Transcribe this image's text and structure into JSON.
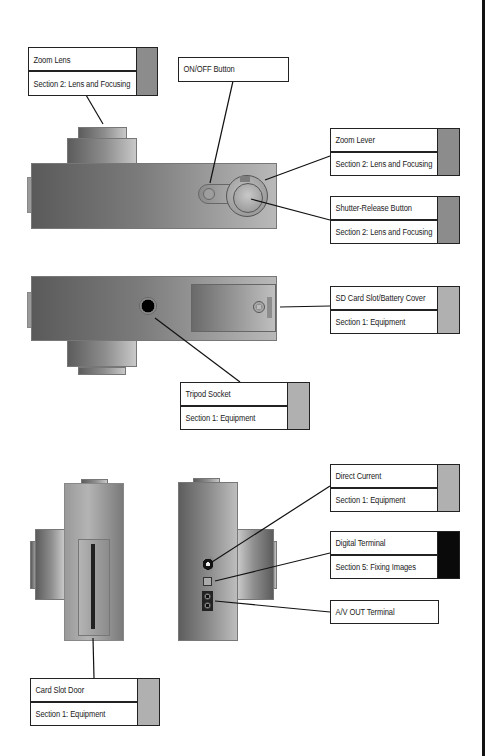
{
  "diagram": {
    "type": "camera-parts-callout",
    "views": [
      "top",
      "bottom",
      "front-side",
      "back-side"
    ]
  },
  "callouts": {
    "zoom_lens": {
      "title": "Zoom Lens",
      "section": "Section 2: Lens and Focusing",
      "swatch_color": "#8c8c8c"
    },
    "on_off": {
      "title": "ON/OFF Button"
    },
    "zoom_lever": {
      "title": "Zoom Lever",
      "section": "Section 2: Lens and Focusing",
      "swatch_color": "#8c8c8c"
    },
    "shutter": {
      "title": "Shutter-Release Button",
      "section": "Section 2: Lens and Focusing",
      "swatch_color": "#8c8c8c"
    },
    "sd_card": {
      "title": "SD Card Slot/Battery Cover",
      "section": "Section 1: Equipment",
      "swatch_color": "#b0b0b0"
    },
    "tripod": {
      "title": "Tripod Socket",
      "section": "Section 1: Equipment",
      "swatch_color": "#b0b0b0"
    },
    "direct_current": {
      "title": "Direct Current",
      "section": "Section 1: Equipment",
      "swatch_color": "#b0b0b0"
    },
    "digital_terminal": {
      "title": "Digital Terminal",
      "section": "Section 5: Fixing Images",
      "swatch_color": "#0a0a0a"
    },
    "av_out": {
      "title": "A/V OUT Terminal"
    },
    "card_slot_door": {
      "title": "Card Slot Door",
      "section": "Section 1: Equipment",
      "swatch_color": "#b0b0b0"
    }
  },
  "legend": {
    "section_colors": [
      {
        "section": "Section 1: Equipment",
        "color": "#b0b0b0"
      },
      {
        "section": "Section 2: Lens and Focusing",
        "color": "#8c8c8c"
      },
      {
        "section": "Section 5: Fixing Images",
        "color": "#0a0a0a"
      }
    ]
  }
}
